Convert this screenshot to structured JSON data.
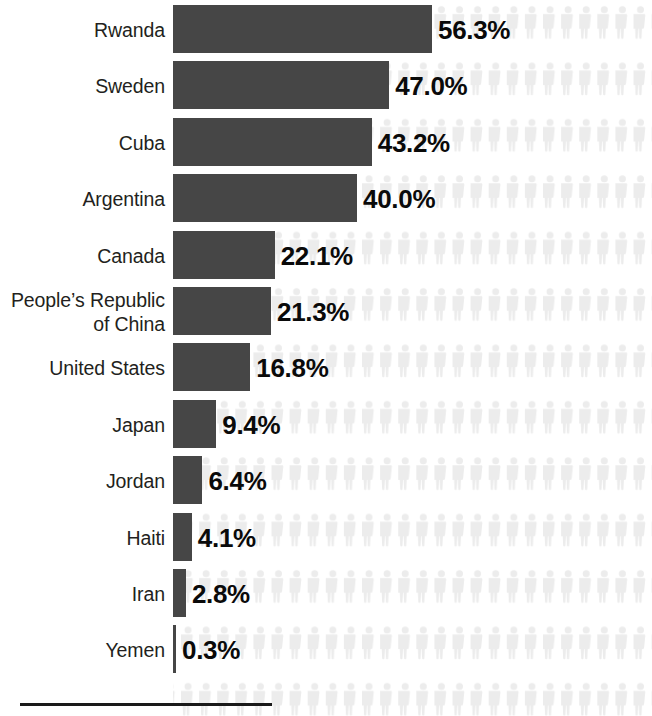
{
  "chart_data": {
    "type": "bar",
    "title": "",
    "subtitle": "",
    "xlabel": "",
    "ylabel": "",
    "orientation": "horizontal",
    "grid": false,
    "legend": false,
    "xlim": [
      0,
      60
    ],
    "value_suffix": "%",
    "categories": [
      "Rwanda",
      "Sweden",
      "Cuba",
      "Argentina",
      "Canada",
      "People’s Republic\nof China",
      "United States",
      "Japan",
      "Jordan",
      "Haiti",
      "Iran",
      "Yemen"
    ],
    "values": [
      56.3,
      47.0,
      43.2,
      40.0,
      22.1,
      21.3,
      16.8,
      9.4,
      6.4,
      4.1,
      2.8,
      0.3
    ],
    "value_labels": [
      "56.3%",
      "47.0%",
      "43.2%",
      "40.0%",
      "22.1%",
      "21.3%",
      "16.8%",
      "9.4%",
      "6.4%",
      "4.1%",
      "2.8%",
      "0.3%"
    ],
    "series": [
      {
        "name": "Share",
        "values": [
          56.3,
          47.0,
          43.2,
          40.0,
          22.1,
          21.3,
          16.8,
          9.4,
          6.4,
          4.1,
          2.8,
          0.3
        ]
      }
    ],
    "colors": {
      "bar": "#464646",
      "value_text": "#0a0a0a",
      "category_text": "#231f20",
      "pictogram": "#ececec",
      "axis_rule": "#1a1a1a",
      "background": "#ffffff"
    },
    "annotations": {
      "pictogram_icon": "person-icon",
      "pictogram_note": "faint repeating human silhouettes fill the plotting area behind every row"
    }
  },
  "rows": [
    {
      "label": "Rwanda",
      "value_label": "56.3%",
      "value": 56.3
    },
    {
      "label": "Sweden",
      "value_label": "47.0%",
      "value": 47.0
    },
    {
      "label": "Cuba",
      "value_label": "43.2%",
      "value": 43.2
    },
    {
      "label": "Argentina",
      "value_label": "40.0%",
      "value": 40.0
    },
    {
      "label": "Canada",
      "value_label": "22.1%",
      "value": 22.1
    },
    {
      "label": "People’s Republic\nof China",
      "value_label": "21.3%",
      "value": 21.3
    },
    {
      "label": "United States",
      "value_label": "16.8%",
      "value": 16.8
    },
    {
      "label": "Japan",
      "value_label": "9.4%",
      "value": 9.4
    },
    {
      "label": "Jordan",
      "value_label": "6.4%",
      "value": 6.4
    },
    {
      "label": "Haiti",
      "value_label": "4.1%",
      "value": 4.1
    },
    {
      "label": "Iran",
      "value_label": "2.8%",
      "value": 2.8
    },
    {
      "label": "Yemen",
      "value_label": "0.3%",
      "value": 0.3
    }
  ],
  "axis": {
    "rule_label": ""
  }
}
